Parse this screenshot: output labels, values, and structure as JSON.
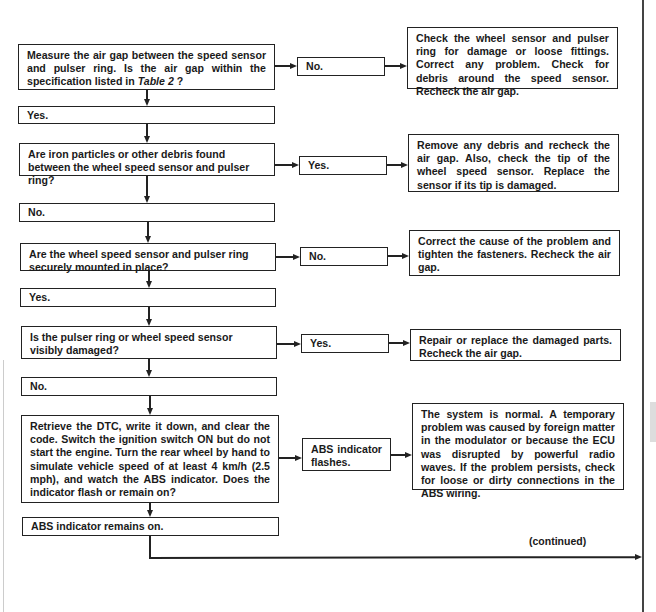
{
  "flowchart": {
    "step1": {
      "question_pre": "Measure the air gap between the speed sensor and pulser ring. Is the air gap within the specification listed in ",
      "question_ref": "Table 2",
      "question_post": " ?",
      "branch_right_label": "No.",
      "branch_right_action": "Check the wheel sensor and pulser ring for damage or loose fittings. Correct any problem. Check for debris around the speed sensor. Recheck the air gap.",
      "branch_down_label": "Yes."
    },
    "step2": {
      "question": "Are iron particles or other debris found between the wheel speed sensor and pulser ring?",
      "branch_right_label": "Yes.",
      "branch_right_action": "Remove any debris and recheck the air gap. Also, check the tip of the wheel speed sensor. Replace the sensor if its tip is damaged.",
      "branch_down_label": "No."
    },
    "step3": {
      "question": "Are the wheel speed sensor and pulser ring securely mounted in place?",
      "branch_right_label": "No.",
      "branch_right_action": "Correct the cause of the problem and tighten the fasteners. Recheck the air gap.",
      "branch_down_label": "Yes."
    },
    "step4": {
      "question": "Is the pulser ring or wheel speed sensor visibly damaged?",
      "branch_right_label": "Yes.",
      "branch_right_action": "Repair or replace the damaged parts. Recheck the air gap.",
      "branch_down_label": "No."
    },
    "step5": {
      "question": "Retrieve the DTC, write it down, and clear the code. Switch the ignition switch ON but do not start the engine. Turn the rear wheel by hand to simulate vehicle speed of at least 4 km/h (2.5 mph), and watch the ABS indicator. Does the indicator flash or remain on?",
      "branch_right_label": "ABS indicator flashes.",
      "branch_right_action": "The system is normal. A temporary problem was caused by foreign matter in the modulator or because the ECU was disrupted by powerful radio waves. If the problem persists, check for loose or dirty connections in the ABS wiring.",
      "branch_down_label": "ABS indicator remains on."
    },
    "continued_label": "(continued)"
  }
}
